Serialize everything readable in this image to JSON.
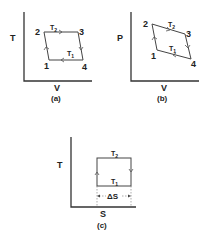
{
  "diagrams": [
    {
      "id": "a",
      "caption": "(a)",
      "y_axis_label": "T",
      "x_axis_label": "V",
      "points": [
        {
          "label": "1",
          "x": 49,
          "y": 60
        },
        {
          "label": "2",
          "x": 44,
          "y": 32
        },
        {
          "label": "3",
          "x": 78,
          "y": 32
        },
        {
          "label": "4",
          "x": 83,
          "y": 60
        }
      ],
      "edge_labels": {
        "top": "T",
        "top_sub": "2",
        "bottom": "T",
        "bottom_sub": "1"
      }
    },
    {
      "id": "b",
      "caption": "(b)",
      "y_axis_label": "P",
      "x_axis_label": "V",
      "points": [
        {
          "label": "1",
          "x": 157,
          "y": 50
        },
        {
          "label": "2",
          "x": 152,
          "y": 24
        },
        {
          "label": "3",
          "x": 185,
          "y": 34
        },
        {
          "label": "4",
          "x": 191,
          "y": 59
        }
      ],
      "edge_labels": {
        "top": "T",
        "top_sub": "2",
        "bottom": "T",
        "bottom_sub": "1"
      }
    },
    {
      "id": "c",
      "caption": "(c)",
      "y_axis_label": "T",
      "x_axis_label": "S",
      "edge_labels": {
        "top": "T",
        "top_sub": "2",
        "bottom": "T",
        "bottom_sub": "1"
      },
      "width_label": "ΔS"
    }
  ]
}
